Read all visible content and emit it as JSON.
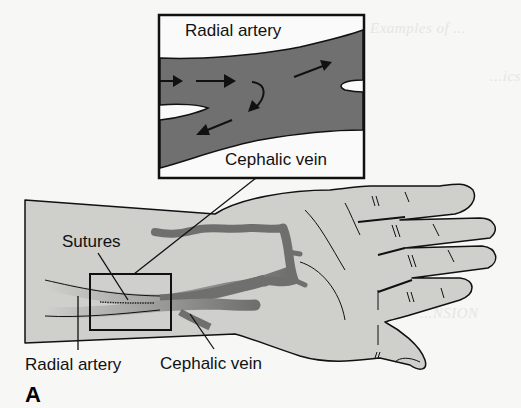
{
  "figure": {
    "panel_letter": "A",
    "colors": {
      "background": "#f7f7f5",
      "skin": "#cfcfcc",
      "vessel": "#6f6f6d",
      "vessel_inset": "#707070",
      "outline": "#111111"
    },
    "inset": {
      "title": "Radial artery",
      "bottom_label": "Cephalic vein",
      "flow_arrows": [
        "arrow-right-1",
        "arrow-right-2",
        "arrow-curve-down",
        "arrow-left-down",
        "arrow-up-right"
      ]
    },
    "labels": {
      "sutures": "Sutures",
      "radial_artery": "Radial artery",
      "cephalic_vein": "Cephalic vein"
    },
    "bleed_through_text": [
      "Examples of ...",
      "...ics",
      "...NSION"
    ]
  }
}
